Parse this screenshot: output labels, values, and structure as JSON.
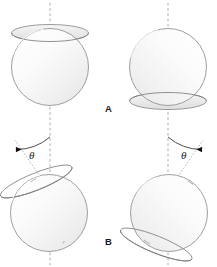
{
  "figure": {
    "title": "",
    "background_color": "#ffffff",
    "width": 217,
    "height": 267,
    "panels": [
      {
        "id": "A",
        "label": "A",
        "label_x": 105,
        "label_y": 112,
        "description": "upright discs",
        "tilt_deg": 0,
        "objects": [
          {
            "name": "disc-top-left",
            "cx": 50,
            "cy": 67,
            "r": 39,
            "cap_position": "top",
            "cap_offset": -6,
            "cap_ry": 9,
            "tilt_deg": 0
          },
          {
            "name": "disc-top-right",
            "cx": 168,
            "cy": 67,
            "r": 39,
            "cap_position": "bottom",
            "cap_offset": 6,
            "cap_ry": 9,
            "tilt_deg": 0
          }
        ]
      },
      {
        "id": "B",
        "label": "B",
        "label_x": 105,
        "label_y": 245,
        "description": "tilted discs with angle theta",
        "tilt_deg": 22,
        "objects": [
          {
            "name": "disc-bottom-left",
            "cx": 50,
            "cy": 213,
            "r": 39,
            "cap_position": "top",
            "cap_offset": -6,
            "cap_ry": 9,
            "tilt_deg": -22
          },
          {
            "name": "disc-bottom-right",
            "cx": 168,
            "cy": 213,
            "r": 39,
            "cap_position": "bottom",
            "cap_offset": 6,
            "cap_ry": 9,
            "tilt_deg": 22
          }
        ]
      }
    ],
    "axes": [
      {
        "name": "axis-left",
        "x": 50,
        "y1": 4,
        "y2": 264,
        "style": "dashed",
        "color": "#9a9a9a"
      },
      {
        "name": "axis-right",
        "x": 168,
        "y1": 4,
        "y2": 264,
        "style": "dashed",
        "color": "#9a9a9a"
      }
    ],
    "angle_annotations": [
      {
        "name": "angle-left",
        "symbol": "θ",
        "value_deg": 22,
        "direction": "counterclockwise",
        "vertex_x": 50,
        "vertex_y": 188,
        "label_x": 30,
        "label_y": 158,
        "arc_radius": 48,
        "arrow": "left"
      },
      {
        "name": "angle-right",
        "symbol": "θ",
        "value_deg": 22,
        "direction": "clockwise",
        "vertex_x": 168,
        "vertex_y": 188,
        "label_x": 184,
        "label_y": 158,
        "arc_radius": 48,
        "arrow": "right"
      }
    ],
    "colors": {
      "stroke": "#8c8c8c",
      "stroke_dark": "#6e6e6e",
      "axis": "#9a9a9a",
      "fill_light": "#fdfdfd",
      "fill_mid": "#ebebeb",
      "fill_shadow": "#dcdcdc",
      "text": "#1a1a1a"
    }
  }
}
